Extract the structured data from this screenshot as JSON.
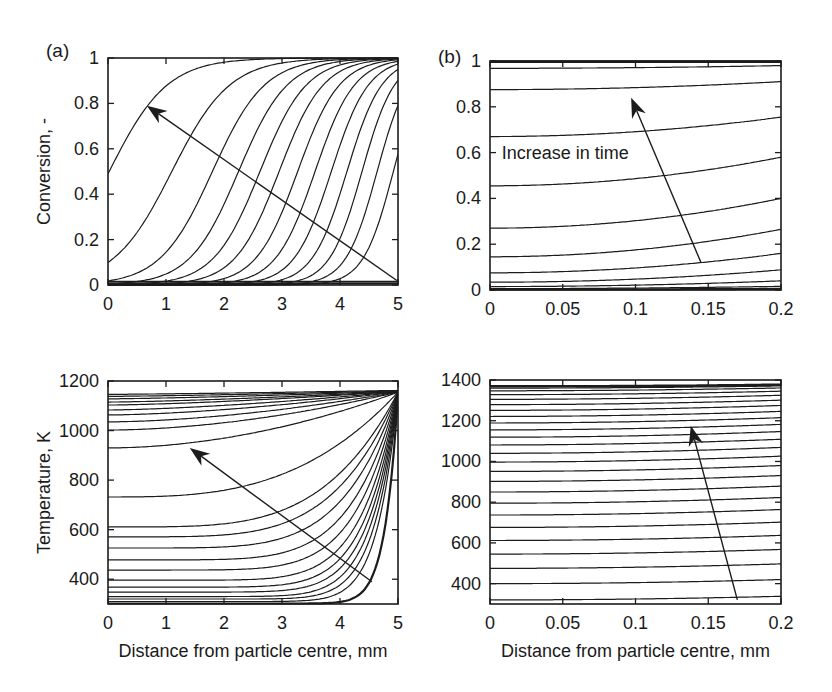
{
  "figure": {
    "background": "#ffffff",
    "line_color": "#1c1c1c",
    "text_color": "#1a1a1a",
    "panel_labels": [
      "(a)",
      "(b)"
    ]
  },
  "chart_data": [
    {
      "id": "conversion-coarse",
      "panel_label": "(a)",
      "type": "line",
      "title": "",
      "xlabel": "",
      "ylabel": "Conversion, -",
      "xlim": [
        0,
        5
      ],
      "ylim": [
        0,
        1
      ],
      "grid": false,
      "legend": null,
      "xticks": [
        0,
        1,
        2,
        3,
        4,
        5
      ],
      "xtick_labels": [
        "0",
        "1",
        "2",
        "3",
        "4",
        "5"
      ],
      "yticks": [
        0,
        0.2,
        0.4,
        0.6,
        0.8,
        1
      ],
      "ytick_labels": [
        "0",
        "0.2",
        "0.4",
        "0.6",
        "0.8",
        "1"
      ],
      "series_family": "conversion profiles at successive times; reaction front moves left as time increases (arrow direction)",
      "series": [
        {
          "model": "flat",
          "y": 0.007,
          "lw": 2.4
        },
        {
          "model": "flat",
          "y": 0.016,
          "lw": 1.2
        },
        {
          "model": "logistic",
          "midpoint": 4.92,
          "width": 0.26
        },
        {
          "model": "logistic",
          "midpoint": 4.64,
          "width": 0.27
        },
        {
          "model": "logistic",
          "midpoint": 4.38,
          "width": 0.28
        },
        {
          "model": "logistic",
          "midpoint": 4.12,
          "width": 0.3
        },
        {
          "model": "logistic",
          "midpoint": 3.85,
          "width": 0.32
        },
        {
          "model": "logistic",
          "midpoint": 3.57,
          "width": 0.34
        },
        {
          "model": "logistic",
          "midpoint": 3.27,
          "width": 0.36
        },
        {
          "model": "logistic",
          "midpoint": 2.95,
          "width": 0.38
        },
        {
          "model": "logistic",
          "midpoint": 2.62,
          "width": 0.4
        },
        {
          "model": "logistic",
          "midpoint": 2.25,
          "width": 0.42
        },
        {
          "model": "logistic",
          "midpoint": 1.8,
          "width": 0.45
        },
        {
          "model": "logistic",
          "midpoint": 1.1,
          "width": 0.5
        },
        {
          "model": "logistic",
          "midpoint": 0.02,
          "width": 0.5
        }
      ],
      "arrow": {
        "from": [
          4.98,
          0.02
        ],
        "to": [
          0.67,
          0.79
        ]
      }
    },
    {
      "id": "conversion-fine",
      "panel_label": "(b)",
      "type": "line",
      "title": "",
      "xlabel": "",
      "ylabel": "",
      "xlim": [
        0,
        0.2
      ],
      "ylim": [
        0,
        1
      ],
      "grid": false,
      "legend": null,
      "xticks": [
        0,
        0.05,
        0.1,
        0.15,
        0.2
      ],
      "xtick_labels": [
        "0",
        "0.05",
        "0.1",
        "0.15",
        "0.2"
      ],
      "yticks": [
        0,
        0.2,
        0.4,
        0.6,
        0.8,
        1
      ],
      "ytick_labels": [
        "0",
        "0.2",
        "0.4",
        "0.6",
        "0.8",
        "1"
      ],
      "series_family": "conversion profiles near particle centre at successive times",
      "series": [
        {
          "model": "power",
          "left": 0.002,
          "right": 0.005,
          "p": 2,
          "lw": 2.2
        },
        {
          "model": "power",
          "left": 0.006,
          "right": 0.016,
          "p": 2
        },
        {
          "model": "power",
          "left": 0.015,
          "right": 0.04,
          "p": 2
        },
        {
          "model": "power",
          "left": 0.034,
          "right": 0.088,
          "p": 2
        },
        {
          "model": "power",
          "left": 0.075,
          "right": 0.16,
          "p": 2
        },
        {
          "model": "power",
          "left": 0.145,
          "right": 0.265,
          "p": 2
        },
        {
          "model": "power",
          "left": 0.27,
          "right": 0.4,
          "p": 2
        },
        {
          "model": "power",
          "left": 0.455,
          "right": 0.58,
          "p": 2
        },
        {
          "model": "power",
          "left": 0.67,
          "right": 0.755,
          "p": 2
        },
        {
          "model": "power",
          "left": 0.875,
          "right": 0.91,
          "p": 2
        },
        {
          "model": "power",
          "left": 0.968,
          "right": 0.98,
          "p": 2
        },
        {
          "model": "flat",
          "y": 0.996,
          "lw": 2.4
        },
        {
          "model": "flat",
          "y": 1.0,
          "lw": 1.2
        }
      ],
      "annotation": {
        "text": "Increase in time",
        "x": 0.008,
        "y": 0.6
      },
      "arrow": {
        "from": [
          0.145,
          0.12
        ],
        "to": [
          0.097,
          0.84
        ]
      }
    },
    {
      "id": "temperature-coarse",
      "panel_label": "",
      "type": "line",
      "title": "",
      "xlabel": "Distance from particle centre, mm",
      "ylabel": "Temperature, K",
      "xlim": [
        0,
        5
      ],
      "ylim": [
        300,
        1200
      ],
      "grid": false,
      "legend": null,
      "xticks": [
        0,
        1,
        2,
        3,
        4,
        5
      ],
      "xtick_labels": [
        "0",
        "1",
        "2",
        "3",
        "4",
        "5"
      ],
      "yticks": [
        400,
        600,
        800,
        1000,
        1200
      ],
      "ytick_labels": [
        "400",
        "600",
        "800",
        "1000",
        "1200"
      ],
      "series_family": "temperature profiles at successive times, heating from the outer surface inward; all converge near 1155 K at the surface",
      "series": [
        {
          "model": "power",
          "left": 302,
          "right": 1148,
          "p": 22,
          "lw": 2.2
        },
        {
          "model": "power",
          "left": 310,
          "right": 1149,
          "p": 14
        },
        {
          "model": "power",
          "left": 320,
          "right": 1150,
          "p": 12
        },
        {
          "model": "power",
          "left": 330,
          "right": 1150,
          "p": 10.5
        },
        {
          "model": "power",
          "left": 348,
          "right": 1151,
          "p": 9.5
        },
        {
          "model": "power",
          "left": 368,
          "right": 1151,
          "p": 8.6
        },
        {
          "model": "power",
          "left": 396,
          "right": 1152,
          "p": 7.8
        },
        {
          "model": "power",
          "left": 437,
          "right": 1152,
          "p": 7.0
        },
        {
          "model": "power",
          "left": 478,
          "right": 1153,
          "p": 6.2
        },
        {
          "model": "power",
          "left": 526,
          "right": 1153,
          "p": 5.4
        },
        {
          "model": "power",
          "left": 571,
          "right": 1154,
          "p": 4.7
        },
        {
          "model": "power",
          "left": 611,
          "right": 1154,
          "p": 4.1
        },
        {
          "model": "power",
          "left": 732,
          "right": 1155,
          "p": 3.0
        },
        {
          "model": "power",
          "left": 930,
          "right": 1155,
          "p": 1.9
        },
        {
          "model": "power",
          "left": 1002,
          "right": 1156,
          "p": 1.8
        },
        {
          "model": "power",
          "left": 1035,
          "right": 1156,
          "p": 1.7
        },
        {
          "model": "power",
          "left": 1063,
          "right": 1157,
          "p": 1.6
        },
        {
          "model": "power",
          "left": 1083,
          "right": 1157,
          "p": 1.5
        },
        {
          "model": "power",
          "left": 1103,
          "right": 1158,
          "p": 1.45
        },
        {
          "model": "power",
          "left": 1115,
          "right": 1158,
          "p": 1.4
        },
        {
          "model": "power",
          "left": 1128,
          "right": 1159,
          "p": 1.35
        },
        {
          "model": "power",
          "left": 1138,
          "right": 1160,
          "p": 1.3
        },
        {
          "model": "power",
          "left": 1146,
          "right": 1162,
          "p": 1.25
        }
      ],
      "arrow": {
        "from": [
          4.55,
          390
        ],
        "to": [
          1.41,
          930
        ]
      }
    },
    {
      "id": "temperature-fine",
      "panel_label": "",
      "type": "line",
      "title": "",
      "xlabel": "Distance from particle centre, mm",
      "ylabel": "",
      "xlim": [
        0,
        0.2
      ],
      "ylim": [
        300,
        1400
      ],
      "grid": false,
      "legend": null,
      "xticks": [
        0,
        0.05,
        0.1,
        0.15,
        0.2
      ],
      "xtick_labels": [
        "0",
        "0.05",
        "0.1",
        "0.15",
        "0.2"
      ],
      "yticks": [
        400,
        600,
        800,
        1000,
        1200,
        1400
      ],
      "ytick_labels": [
        "400",
        "600",
        "800",
        "1000",
        "1200",
        "1400"
      ],
      "series_family": "temperature profiles near particle centre at successive times, approaching about 1370 K",
      "series": [
        {
          "model": "power",
          "left": 320,
          "right": 338,
          "p": 2
        },
        {
          "model": "power",
          "left": 400,
          "right": 420,
          "p": 2
        },
        {
          "model": "power",
          "left": 475,
          "right": 497,
          "p": 2
        },
        {
          "model": "power",
          "left": 545,
          "right": 568,
          "p": 2
        },
        {
          "model": "power",
          "left": 612,
          "right": 637,
          "p": 2
        },
        {
          "model": "power",
          "left": 676,
          "right": 702,
          "p": 2
        },
        {
          "model": "power",
          "left": 737,
          "right": 764,
          "p": 2
        },
        {
          "model": "power",
          "left": 795,
          "right": 823,
          "p": 2
        },
        {
          "model": "power",
          "left": 850,
          "right": 879,
          "p": 2
        },
        {
          "model": "power",
          "left": 902,
          "right": 931,
          "p": 2
        },
        {
          "model": "power",
          "left": 951,
          "right": 980,
          "p": 2
        },
        {
          "model": "power",
          "left": 997,
          "right": 1026,
          "p": 2
        },
        {
          "model": "power",
          "left": 1040,
          "right": 1069,
          "p": 2
        },
        {
          "model": "power",
          "left": 1081,
          "right": 1109,
          "p": 2
        },
        {
          "model": "power",
          "left": 1119,
          "right": 1147,
          "p": 2
        },
        {
          "model": "power",
          "left": 1155,
          "right": 1182,
          "p": 2
        },
        {
          "model": "power",
          "left": 1189,
          "right": 1215,
          "p": 2
        },
        {
          "model": "power",
          "left": 1221,
          "right": 1246,
          "p": 2
        },
        {
          "model": "power",
          "left": 1251,
          "right": 1275,
          "p": 2
        },
        {
          "model": "power",
          "left": 1279,
          "right": 1301,
          "p": 2
        },
        {
          "model": "power",
          "left": 1305,
          "right": 1325,
          "p": 2
        },
        {
          "model": "power",
          "left": 1328,
          "right": 1345,
          "p": 2
        },
        {
          "model": "power",
          "left": 1347,
          "right": 1361,
          "p": 2
        },
        {
          "model": "power",
          "left": 1360,
          "right": 1371,
          "p": 2
        },
        {
          "model": "power",
          "left": 1369,
          "right": 1377,
          "p": 2.6,
          "lw": 2.6
        }
      ],
      "arrow": {
        "from": [
          0.17,
          320
        ],
        "to": [
          0.138,
          1175
        ]
      }
    }
  ]
}
